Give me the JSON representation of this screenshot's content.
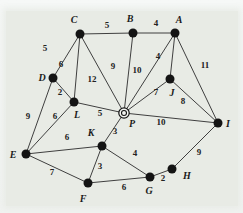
{
  "figure": {
    "type": "weighted-undirected-graph",
    "colors": {
      "paper_background": "#e8ebe5",
      "frame_background": "#f4f6f5",
      "edge": "#3f3f3f",
      "node_fill": "#141414",
      "text": "#1b1b1b"
    },
    "highlighted_node": "P",
    "nodes": [
      {
        "id": "A",
        "x": 175,
        "y": 33,
        "label_x": 179,
        "label_y": 19
      },
      {
        "id": "B",
        "x": 133,
        "y": 33,
        "label_x": 130,
        "label_y": 18
      },
      {
        "id": "C",
        "x": 80,
        "y": 34,
        "label_x": 74,
        "label_y": 19
      },
      {
        "id": "D",
        "x": 53,
        "y": 78,
        "label_x": 42,
        "label_y": 77
      },
      {
        "id": "E",
        "x": 26,
        "y": 154,
        "label_x": 13,
        "label_y": 154
      },
      {
        "id": "F",
        "x": 88,
        "y": 183,
        "label_x": 83,
        "label_y": 198
      },
      {
        "id": "G",
        "x": 150,
        "y": 177,
        "label_x": 149,
        "label_y": 190
      },
      {
        "id": "H",
        "x": 172,
        "y": 169,
        "label_x": 187,
        "label_y": 175
      },
      {
        "id": "I",
        "x": 218,
        "y": 123,
        "label_x": 228,
        "label_y": 123
      },
      {
        "id": "J",
        "x": 170,
        "y": 79,
        "label_x": 172,
        "label_y": 92
      },
      {
        "id": "K",
        "x": 102,
        "y": 146,
        "label_x": 91,
        "label_y": 132
      },
      {
        "id": "L",
        "x": 74,
        "y": 102,
        "label_x": 77,
        "label_y": 114
      },
      {
        "id": "P",
        "x": 124,
        "y": 113,
        "label_x": 132,
        "label_y": 123,
        "style": "double-circle"
      }
    ],
    "edges": [
      {
        "from": "C",
        "to": "B",
        "weight": 5,
        "wx": 107,
        "wy": 25
      },
      {
        "from": "B",
        "to": "A",
        "weight": 4,
        "wx": 156,
        "wy": 23
      },
      {
        "from": "C",
        "to": "D",
        "weight": 5,
        "wx": 45,
        "wy": 48
      },
      {
        "from": "C",
        "to": "L",
        "weight": 6,
        "wx": 61,
        "wy": 64
      },
      {
        "from": "C",
        "to": "P",
        "weight": 12,
        "wx": 92,
        "wy": 79
      },
      {
        "from": "B",
        "to": "P",
        "weight": 9,
        "wx": 113,
        "wy": 66
      },
      {
        "from": "A",
        "to": "P",
        "weight": 10,
        "wx": 137,
        "wy": 70
      },
      {
        "from": "A",
        "to": "J",
        "weight": 4,
        "wx": 158,
        "wy": 56
      },
      {
        "from": "A",
        "to": "I",
        "weight": 11,
        "wx": 205,
        "wy": 65
      },
      {
        "from": "D",
        "to": "L",
        "weight": 2,
        "wx": 60,
        "wy": 92
      },
      {
        "from": "D",
        "to": "E",
        "weight": 9,
        "wx": 28,
        "wy": 116
      },
      {
        "from": "L",
        "to": "E",
        "weight": 6,
        "wx": 55,
        "wy": 116
      },
      {
        "from": "L",
        "to": "P",
        "weight": 5,
        "wx": 100,
        "wy": 113
      },
      {
        "from": "P",
        "to": "J",
        "weight": 7,
        "wx": 156,
        "wy": 92
      },
      {
        "from": "J",
        "to": "I",
        "weight": 8,
        "wx": 183,
        "wy": 101
      },
      {
        "from": "P",
        "to": "I",
        "weight": 10,
        "wx": 161,
        "wy": 122
      },
      {
        "from": "P",
        "to": "K",
        "weight": 3,
        "wx": 115,
        "wy": 131
      },
      {
        "from": "E",
        "to": "K",
        "weight": 6,
        "wx": 67,
        "wy": 137
      },
      {
        "from": "E",
        "to": "F",
        "weight": 7,
        "wx": 52,
        "wy": 172
      },
      {
        "from": "K",
        "to": "F",
        "weight": 3,
        "wx": 100,
        "wy": 166
      },
      {
        "from": "K",
        "to": "G",
        "weight": 4,
        "wx": 135,
        "wy": 153
      },
      {
        "from": "F",
        "to": "G",
        "weight": 6,
        "wx": 124,
        "wy": 187
      },
      {
        "from": "G",
        "to": "H",
        "weight": 2,
        "wx": 163,
        "wy": 178
      },
      {
        "from": "H",
        "to": "I",
        "weight": 9,
        "wx": 199,
        "wy": 152
      }
    ],
    "node_radius": 4.5,
    "double_circle": {
      "outer_radius": 5.2,
      "inner_radius": 2.5
    }
  }
}
